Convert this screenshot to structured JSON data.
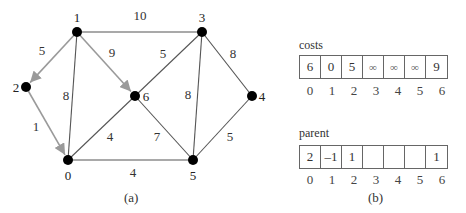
{
  "figure_a": {
    "caption": "(a)",
    "nodes": [
      {
        "id": "0",
        "x": 68,
        "y": 160,
        "lx": 68,
        "ly": 180,
        "anchor": "middle"
      },
      {
        "id": "1",
        "x": 77,
        "y": 32,
        "lx": 77,
        "ly": 22,
        "anchor": "middle"
      },
      {
        "id": "2",
        "x": 26,
        "y": 87,
        "lx": 16,
        "ly": 92,
        "anchor": "middle"
      },
      {
        "id": "3",
        "x": 202,
        "y": 32,
        "lx": 202,
        "ly": 22,
        "anchor": "middle"
      },
      {
        "id": "4",
        "x": 252,
        "y": 96,
        "lx": 262,
        "ly": 101,
        "anchor": "middle"
      },
      {
        "id": "5",
        "x": 193,
        "y": 160,
        "lx": 193,
        "ly": 180,
        "anchor": "middle"
      },
      {
        "id": "6",
        "x": 135,
        "y": 96,
        "lx": 146,
        "ly": 101,
        "anchor": "middle"
      }
    ],
    "edges": [
      {
        "from": "1",
        "to": "3",
        "weight": "10",
        "lx": 140,
        "ly": 20,
        "highlight": false
      },
      {
        "from": "1",
        "to": "2",
        "weight": "5",
        "lx": 42,
        "ly": 55,
        "highlight": true
      },
      {
        "from": "1",
        "to": "6",
        "weight": "9",
        "lx": 112,
        "ly": 57,
        "highlight": true
      },
      {
        "from": "1",
        "to": "0",
        "weight": "8",
        "lx": 66,
        "ly": 100,
        "highlight": false
      },
      {
        "from": "2",
        "to": "0",
        "weight": "1",
        "lx": 36,
        "ly": 131,
        "highlight": true
      },
      {
        "from": "3",
        "to": "6",
        "weight": "5",
        "lx": 163,
        "ly": 58,
        "highlight": false
      },
      {
        "from": "3",
        "to": "5",
        "weight": "8",
        "lx": 188,
        "ly": 99,
        "highlight": false
      },
      {
        "from": "3",
        "to": "4",
        "weight": "8",
        "lx": 233,
        "ly": 58,
        "highlight": false
      },
      {
        "from": "6",
        "to": "0",
        "weight": "4",
        "lx": 110,
        "ly": 141,
        "highlight": false
      },
      {
        "from": "6",
        "to": "5",
        "weight": "7",
        "lx": 157,
        "ly": 141,
        "highlight": false
      },
      {
        "from": "0",
        "to": "5",
        "weight": "4",
        "lx": 133,
        "ly": 177,
        "highlight": false
      },
      {
        "from": "4",
        "to": "5",
        "weight": "5",
        "lx": 230,
        "ly": 141,
        "highlight": false
      }
    ],
    "colors": {
      "edge": "#555555",
      "highlight": "#9a9a9a",
      "node": "#000000"
    }
  },
  "figure_b": {
    "caption": "(b)",
    "costs": {
      "label": "costs",
      "values": [
        "6",
        "0",
        "5",
        "∞",
        "∞",
        "∞",
        "9"
      ],
      "indices": [
        "0",
        "1",
        "2",
        "3",
        "4",
        "5",
        "6"
      ]
    },
    "parent": {
      "label": "parent",
      "values": [
        "2",
        "–1",
        "1",
        "",
        "",
        "",
        "1"
      ],
      "indices": [
        "0",
        "1",
        "2",
        "3",
        "4",
        "5",
        "6"
      ]
    }
  }
}
